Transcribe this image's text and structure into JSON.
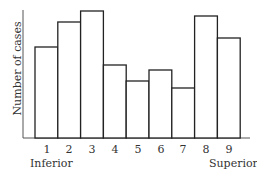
{
  "chart_data": {
    "type": "bar",
    "title": "",
    "xlabel": "",
    "ylabel": "Number of cases",
    "categories": [
      "1",
      "2",
      "3",
      "4",
      "5",
      "6",
      "7",
      "8",
      "9"
    ],
    "values": [
      91,
      116,
      127,
      73,
      57,
      68,
      50,
      122,
      100
    ],
    "value_units": "relative height (no y-axis ticks shown)",
    "annotations": [
      {
        "text": "Inferior",
        "position": "below category 1"
      },
      {
        "text": "Superior",
        "position": "below category 9"
      }
    ],
    "grid": false,
    "legend": null,
    "bar_style": {
      "fill": "#ffffff",
      "stroke": "#222222"
    }
  },
  "labels": {
    "ylabel": "Number of cases",
    "left_end": "Inferior",
    "right_end": "Superior",
    "ticks": [
      "1",
      "2",
      "3",
      "4",
      "5",
      "6",
      "7",
      "8",
      "9"
    ]
  }
}
